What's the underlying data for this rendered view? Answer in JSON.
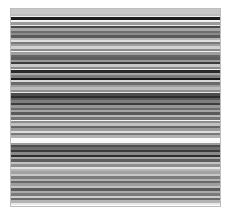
{
  "image": {
    "description": "Grayscale image of dense horizontal stripes (barcode/spectrogram-like texture)",
    "frame": {
      "x": 10,
      "y": 8,
      "width": 211,
      "height": 199,
      "border_color": "#bdbdbd"
    },
    "stripes": [
      {
        "h": 4,
        "c": "#c8c8c8"
      },
      {
        "h": 2,
        "c": "#bdbdbd"
      },
      {
        "h": 1,
        "c": "#eeeeee"
      },
      {
        "h": 2,
        "c": "#1e1e1e"
      },
      {
        "h": 2,
        "c": "#f2f2f2"
      },
      {
        "h": 2,
        "c": "#9a9a9a"
      },
      {
        "h": 1,
        "c": "#e6e6e6"
      },
      {
        "h": 2,
        "c": "#4a4a4a"
      },
      {
        "h": 2,
        "c": "#a5a5a5"
      },
      {
        "h": 2,
        "c": "#6e6e6e"
      },
      {
        "h": 2,
        "c": "#8c8c8c"
      },
      {
        "h": 2,
        "c": "#5a5a5a"
      },
      {
        "h": 2,
        "c": "#b4b4b4"
      },
      {
        "h": 1,
        "c": "#e0e0e0"
      },
      {
        "h": 2,
        "c": "#7a7a7a"
      },
      {
        "h": 2,
        "c": "#a0a0a0"
      },
      {
        "h": 2,
        "c": "#d2d2d2"
      },
      {
        "h": 2,
        "c": "#8a8a8a"
      },
      {
        "h": 1,
        "c": "#f0f0f0"
      },
      {
        "h": 2,
        "c": "#9e9e9e"
      },
      {
        "h": 2,
        "c": "#666666"
      },
      {
        "h": 2,
        "c": "#5e5e5e"
      },
      {
        "h": 2,
        "c": "#9a9a9a"
      },
      {
        "h": 2,
        "c": "#3c3c3c"
      },
      {
        "h": 2,
        "c": "#c8c8c8"
      },
      {
        "h": 2,
        "c": "#8a8a8a"
      },
      {
        "h": 1,
        "c": "#f2f2f2"
      },
      {
        "h": 2,
        "c": "#2a2a2a"
      },
      {
        "h": 2,
        "c": "#a8a8a8"
      },
      {
        "h": 2,
        "c": "#7c7c7c"
      },
      {
        "h": 2,
        "c": "#1a1a1a"
      },
      {
        "h": 2,
        "c": "#d6d6d6"
      },
      {
        "h": 2,
        "c": "#6a6a6a"
      },
      {
        "h": 2,
        "c": "#9c9c9c"
      },
      {
        "h": 2,
        "c": "#bcbcbc"
      },
      {
        "h": 2,
        "c": "#8e8e8e"
      },
      {
        "h": 1,
        "c": "#e8e8e8"
      },
      {
        "h": 2,
        "c": "#4c4c4c"
      },
      {
        "h": 2,
        "c": "#2c2c2c"
      },
      {
        "h": 2,
        "c": "#5c5c5c"
      },
      {
        "h": 2,
        "c": "#7e7e7e"
      },
      {
        "h": 2,
        "c": "#3e3e3e"
      },
      {
        "h": 2,
        "c": "#969696"
      },
      {
        "h": 2,
        "c": "#6c6c6c"
      },
      {
        "h": 2,
        "c": "#a4a4a4"
      },
      {
        "h": 2,
        "c": "#5a5a5a"
      },
      {
        "h": 2,
        "c": "#b8b8b8"
      },
      {
        "h": 2,
        "c": "#747474"
      },
      {
        "h": 1,
        "c": "#f4f4f4"
      },
      {
        "h": 2,
        "c": "#8c8c8c"
      },
      {
        "h": 2,
        "c": "#c0c0c0"
      },
      {
        "h": 2,
        "c": "#646464"
      },
      {
        "h": 2,
        "c": "#9a9a9a"
      },
      {
        "h": 2,
        "c": "#dcdcdc"
      },
      {
        "h": 2,
        "c": "#787878"
      },
      {
        "h": 2,
        "c": "#b0b0b0"
      },
      {
        "h": 4,
        "c": "#fafafa"
      },
      {
        "h": 2,
        "c": "#9c9c9c"
      },
      {
        "h": 2,
        "c": "#4e4e4e"
      },
      {
        "h": 2,
        "c": "#6e6e6e"
      },
      {
        "h": 2,
        "c": "#3a3a3a"
      },
      {
        "h": 2,
        "c": "#8a8a8a"
      },
      {
        "h": 2,
        "c": "#2e2e2e"
      },
      {
        "h": 2,
        "c": "#a6a6a6"
      },
      {
        "h": 2,
        "c": "#5e5e5e"
      },
      {
        "h": 2,
        "c": "#c4c4c4"
      },
      {
        "h": 2,
        "c": "#8e8e8e"
      },
      {
        "h": 2,
        "c": "#e4e4e4"
      },
      {
        "h": 2,
        "c": "#b6b6b6"
      },
      {
        "h": 2,
        "c": "#a2a2a2"
      },
      {
        "h": 2,
        "c": "#c8c8c8"
      },
      {
        "h": 2,
        "c": "#7c7c7c"
      },
      {
        "h": 2,
        "c": "#b2b2b2"
      },
      {
        "h": 2,
        "c": "#686868"
      },
      {
        "h": 2,
        "c": "#9e9e9e"
      },
      {
        "h": 2,
        "c": "#c0c0c0"
      },
      {
        "h": 2,
        "c": "#5c5c5c"
      },
      {
        "h": 2,
        "c": "#aaaaaa"
      },
      {
        "h": 2,
        "c": "#7a7a7a"
      },
      {
        "h": 2,
        "c": "#cccccc"
      },
      {
        "h": 2,
        "c": "#6a6a6a"
      },
      {
        "h": 2,
        "c": "#b4b4b4"
      },
      {
        "h": 2,
        "c": "#e8e8e8"
      }
    ]
  }
}
